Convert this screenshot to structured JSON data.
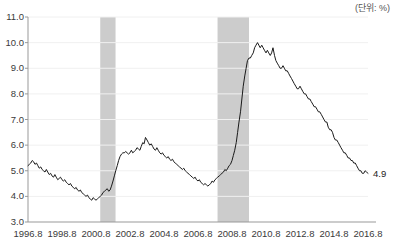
{
  "chart_data": {
    "type": "line",
    "title": "",
    "subtitle": "",
    "unit_label": "(단위: %)",
    "xlabel": "",
    "ylabel": "",
    "ylim": [
      3.0,
      11.0
    ],
    "xlim": [
      1996.8,
      2016.8
    ],
    "grid": true,
    "legend": "none",
    "yticks": [
      "11.0",
      "10.0",
      "9.0",
      "8.0",
      "7.0",
      "6.0",
      "5.0",
      "4.0",
      "3.0"
    ],
    "ytick_values": [
      11.0,
      10.0,
      9.0,
      8.0,
      7.0,
      6.0,
      5.0,
      4.0,
      3.0
    ],
    "xticks": [
      "1996.8",
      "1998.8",
      "2000.8",
      "2002.8",
      "2004.8",
      "2006.8",
      "2008.8",
      "2010.8",
      "2012.8",
      "2014.8",
      "2016.8"
    ],
    "xtick_values": [
      1996.8,
      1998.8,
      2000.8,
      2002.8,
      2004.8,
      2006.8,
      2008.8,
      2010.8,
      2012.8,
      2014.8,
      2016.8
    ],
    "line_color": "#1a1a1a",
    "band_color": "#cccccc",
    "axis_color": "#999999",
    "grid_color": "#f0f0f0",
    "annotations": [
      {
        "name": "end-value",
        "text": "4.9",
        "x": 2016.8,
        "y": 4.9
      }
    ],
    "shaded_regions": [
      {
        "name": "recession-2001",
        "x_start": 2001.05,
        "x_end": 2001.95
      },
      {
        "name": "recession-2008",
        "x_start": 2007.95,
        "x_end": 2009.8
      }
    ],
    "series": [
      {
        "name": "unemployment-rate",
        "x": [
          1996.8,
          1996.88,
          1996.96,
          1997.05,
          1997.13,
          1997.21,
          1997.3,
          1997.38,
          1997.46,
          1997.55,
          1997.63,
          1997.71,
          1997.8,
          1997.88,
          1997.96,
          1998.05,
          1998.13,
          1998.21,
          1998.3,
          1998.38,
          1998.46,
          1998.55,
          1998.63,
          1998.71,
          1998.8,
          1998.88,
          1998.96,
          1999.05,
          1999.13,
          1999.21,
          1999.3,
          1999.38,
          1999.46,
          1999.55,
          1999.63,
          1999.71,
          1999.8,
          1999.88,
          1999.96,
          2000.05,
          2000.13,
          2000.21,
          2000.3,
          2000.38,
          2000.46,
          2000.55,
          2000.63,
          2000.71,
          2000.8,
          2000.88,
          2000.96,
          2001.05,
          2001.13,
          2001.21,
          2001.3,
          2001.38,
          2001.46,
          2001.55,
          2001.63,
          2001.71,
          2001.8,
          2001.88,
          2001.96,
          2002.05,
          2002.13,
          2002.21,
          2002.3,
          2002.38,
          2002.46,
          2002.55,
          2002.63,
          2002.71,
          2002.8,
          2002.88,
          2002.96,
          2003.05,
          2003.13,
          2003.21,
          2003.3,
          2003.38,
          2003.46,
          2003.55,
          2003.63,
          2003.71,
          2003.8,
          2003.88,
          2003.96,
          2004.05,
          2004.13,
          2004.21,
          2004.3,
          2004.38,
          2004.46,
          2004.55,
          2004.63,
          2004.71,
          2004.8,
          2004.88,
          2004.96,
          2005.05,
          2005.13,
          2005.21,
          2005.3,
          2005.38,
          2005.46,
          2005.55,
          2005.63,
          2005.71,
          2005.8,
          2005.88,
          2005.96,
          2006.05,
          2006.13,
          2006.21,
          2006.3,
          2006.38,
          2006.46,
          2006.55,
          2006.63,
          2006.71,
          2006.8,
          2006.88,
          2006.96,
          2007.05,
          2007.13,
          2007.21,
          2007.3,
          2007.38,
          2007.46,
          2007.55,
          2007.63,
          2007.71,
          2007.8,
          2007.88,
          2007.96,
          2008.05,
          2008.13,
          2008.21,
          2008.3,
          2008.38,
          2008.46,
          2008.55,
          2008.63,
          2008.71,
          2008.8,
          2008.88,
          2008.96,
          2009.05,
          2009.13,
          2009.21,
          2009.3,
          2009.38,
          2009.46,
          2009.55,
          2009.63,
          2009.71,
          2009.8,
          2009.88,
          2009.96,
          2010.05,
          2010.13,
          2010.21,
          2010.3,
          2010.38,
          2010.46,
          2010.55,
          2010.63,
          2010.71,
          2010.8,
          2010.88,
          2010.96,
          2011.05,
          2011.13,
          2011.21,
          2011.3,
          2011.38,
          2011.46,
          2011.55,
          2011.63,
          2011.71,
          2011.8,
          2011.88,
          2011.96,
          2012.05,
          2012.13,
          2012.21,
          2012.3,
          2012.38,
          2012.46,
          2012.55,
          2012.63,
          2012.71,
          2012.8,
          2012.88,
          2012.96,
          2013.05,
          2013.13,
          2013.21,
          2013.3,
          2013.38,
          2013.46,
          2013.55,
          2013.63,
          2013.71,
          2013.8,
          2013.88,
          2013.96,
          2014.05,
          2014.13,
          2014.21,
          2014.3,
          2014.38,
          2014.46,
          2014.55,
          2014.63,
          2014.71,
          2014.8,
          2014.88,
          2014.96,
          2015.05,
          2015.13,
          2015.21,
          2015.3,
          2015.38,
          2015.46,
          2015.55,
          2015.63,
          2015.71,
          2015.8,
          2015.88,
          2015.96,
          2016.05,
          2016.13,
          2016.21,
          2016.3,
          2016.38,
          2016.46,
          2016.55,
          2016.63,
          2016.71,
          2016.8
        ],
        "values": [
          5.2,
          5.25,
          5.3,
          5.4,
          5.35,
          5.25,
          5.3,
          5.2,
          5.1,
          5.15,
          5.05,
          5.0,
          4.95,
          5.05,
          4.95,
          4.85,
          4.9,
          4.8,
          4.75,
          4.85,
          4.75,
          4.65,
          4.7,
          4.75,
          4.65,
          4.6,
          4.65,
          4.55,
          4.5,
          4.45,
          4.5,
          4.4,
          4.35,
          4.3,
          4.35,
          4.25,
          4.2,
          4.25,
          4.15,
          4.1,
          4.05,
          4.0,
          4.05,
          3.95,
          3.9,
          3.85,
          3.95,
          3.9,
          3.85,
          3.9,
          3.95,
          4.0,
          4.05,
          4.15,
          4.2,
          4.25,
          4.3,
          4.2,
          4.25,
          4.4,
          4.6,
          4.8,
          5.0,
          5.2,
          5.4,
          5.55,
          5.65,
          5.7,
          5.7,
          5.75,
          5.7,
          5.65,
          5.7,
          5.8,
          5.7,
          5.75,
          5.8,
          5.9,
          5.85,
          5.8,
          5.95,
          6.1,
          6.05,
          6.3,
          6.2,
          6.1,
          6.0,
          6.05,
          5.95,
          5.85,
          5.8,
          5.9,
          5.8,
          5.7,
          5.65,
          5.7,
          5.6,
          5.55,
          5.5,
          5.55,
          5.45,
          5.4,
          5.45,
          5.35,
          5.3,
          5.25,
          5.2,
          5.15,
          5.1,
          5.05,
          5.1,
          5.0,
          4.95,
          4.9,
          4.85,
          4.8,
          4.75,
          4.7,
          4.75,
          4.65,
          4.6,
          4.65,
          4.55,
          4.5,
          4.45,
          4.5,
          4.45,
          4.4,
          4.45,
          4.5,
          4.6,
          4.55,
          4.65,
          4.7,
          4.75,
          4.8,
          4.85,
          4.9,
          4.95,
          5.05,
          5.0,
          5.1,
          5.2,
          5.25,
          5.4,
          5.6,
          5.8,
          6.1,
          6.5,
          6.9,
          7.3,
          7.8,
          8.3,
          8.7,
          9.0,
          9.3,
          9.4,
          9.4,
          9.5,
          9.6,
          9.8,
          9.9,
          10.0,
          9.9,
          9.8,
          9.9,
          9.8,
          9.7,
          9.6,
          9.7,
          9.6,
          9.5,
          9.6,
          9.8,
          9.5,
          9.3,
          9.2,
          9.1,
          9.0,
          9.0,
          9.1,
          9.0,
          8.9,
          8.9,
          8.8,
          8.7,
          8.6,
          8.5,
          8.4,
          8.3,
          8.2,
          8.2,
          8.3,
          8.2,
          8.1,
          8.0,
          8.0,
          7.9,
          7.8,
          7.8,
          7.7,
          7.6,
          7.5,
          7.5,
          7.4,
          7.3,
          7.3,
          7.2,
          7.1,
          7.0,
          6.9,
          6.9,
          6.7,
          6.6,
          6.6,
          6.5,
          6.3,
          6.2,
          6.2,
          6.1,
          6.0,
          5.9,
          5.8,
          5.7,
          5.7,
          5.6,
          5.5,
          5.5,
          5.4,
          5.4,
          5.3,
          5.3,
          5.2,
          5.1,
          5.0,
          5.0,
          4.9,
          4.9,
          5.0,
          4.95,
          4.9
        ]
      }
    ]
  }
}
